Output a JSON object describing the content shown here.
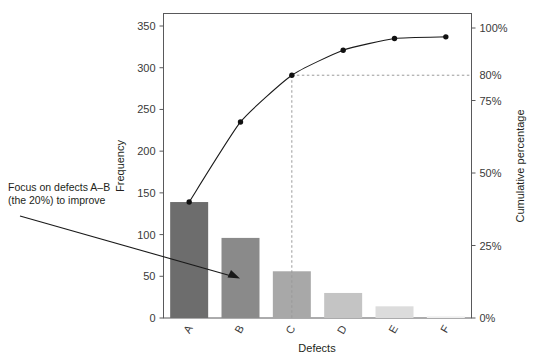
{
  "chart_data": {
    "type": "bar",
    "title": "",
    "subtitle": "",
    "xlabel": "Defects",
    "ylabel": "Frequency",
    "y2label": "Cumulative percentage",
    "categories": [
      "A",
      "B",
      "C",
      "D",
      "E",
      "F"
    ],
    "values": [
      139,
      96,
      56,
      30,
      14,
      2
    ],
    "ylim": [
      0,
      365
    ],
    "y2lim": [
      0,
      105
    ],
    "yticks": [
      0,
      50,
      100,
      150,
      200,
      250,
      300,
      350
    ],
    "ytick_labels": [
      "0",
      "50",
      "100",
      "150",
      "200",
      "250",
      "300",
      "350"
    ],
    "y2ticks": [
      0,
      25,
      50,
      75,
      80,
      100
    ],
    "y2tick_labels": [
      "0%",
      "25%",
      "50%",
      "75%",
      "80%",
      "100%"
    ],
    "grid": false,
    "legend": "none",
    "series": [
      {
        "name": "Frequency",
        "type": "bar",
        "values": [
          139,
          96,
          56,
          30,
          14,
          2
        ],
        "colors": [
          "#6d6d6d",
          "#8a8a8a",
          "#a8a8a8",
          "#c4c4c4",
          "#dcdcdc",
          "#efefef"
        ]
      },
      {
        "name": "Cumulative percentage",
        "type": "line",
        "values": [
          40.0,
          67.6,
          83.8,
          92.4,
          96.5,
          100.0
        ],
        "plot_frequency_equivalent": [
          139,
          235,
          291,
          321,
          335,
          337
        ],
        "marker": "circle",
        "color": "#111111"
      }
    ],
    "reference_lines": [
      {
        "name": "eighty-percent-guide",
        "axis": "y2",
        "value": 80,
        "style": "dashed",
        "label": "80%"
      },
      {
        "name": "category-c-guide",
        "axis": "x",
        "value": "C",
        "style": "dashed"
      }
    ],
    "annotations": [
      {
        "name": "focus-annotation",
        "line1": "Focus on defects A–B",
        "line2": "(the 20%) to improve",
        "arrow_to_category": "B",
        "arrow": true
      }
    ]
  },
  "axes": {
    "left": {
      "title": "Frequency"
    },
    "right": {
      "title": "Cumulative percentage"
    },
    "bottom": {
      "title": "Defects"
    }
  },
  "colors": {
    "frame": "#59595b",
    "curve": "#111111",
    "guide": "#9a9a9a",
    "text": "#231f20",
    "background": "#ffffff"
  }
}
